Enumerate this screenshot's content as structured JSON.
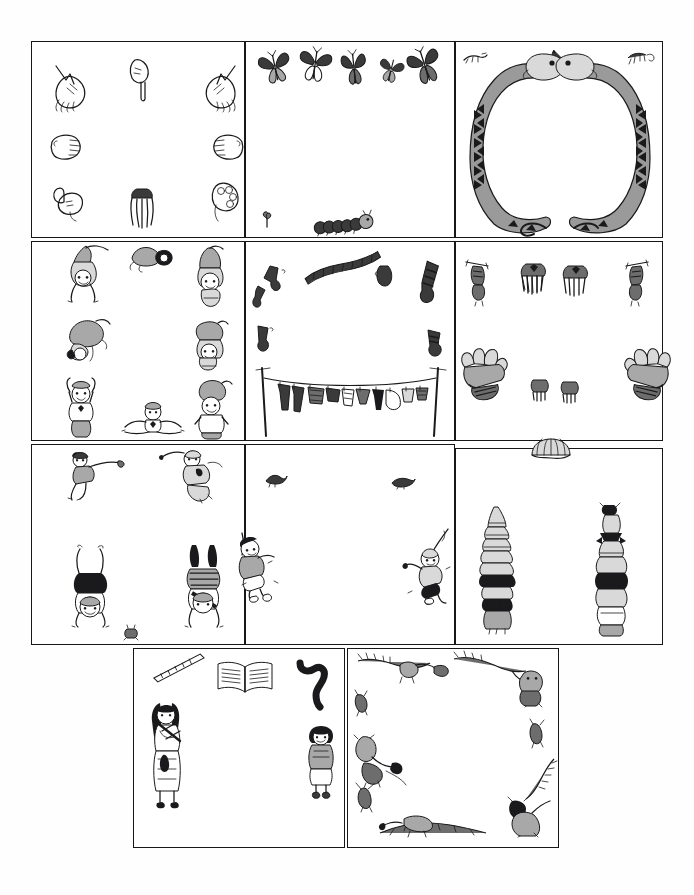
{
  "sheet": {
    "title": "Illustrated Story Panel Grid",
    "background_color": "#ffffff",
    "ink_color": "#1a1a1c",
    "panel_border_color": "#17171a",
    "width": 694,
    "height": 895,
    "description": "Ten rectangular illustration frames arranged in four rows; each frame holds small black-and-white drawings placed around an empty white centre."
  },
  "panels": [
    {
      "id": "panel-hands",
      "row": 1,
      "column": 1,
      "theme": "hands",
      "caption": "Hands",
      "x": 31,
      "y": 41,
      "w": 214,
      "h": 197,
      "items": [
        {
          "name": "open-hand-reaching",
          "note": "open palm, fingers splayed, pointing down-right",
          "x": 18,
          "y": 18,
          "scale": 1.0,
          "rotate": 0
        },
        {
          "name": "pointing-hand",
          "note": "index finger pointing downward",
          "x": 95,
          "y": 14,
          "scale": 0.9,
          "rotate": 0
        },
        {
          "name": "open-hand-reaching-mirrored",
          "note": "open palm mirrored, fingers splayed",
          "x": 165,
          "y": 18,
          "scale": 1.0,
          "rotate": 0
        },
        {
          "name": "fist-left",
          "note": "closed fist facing right",
          "x": 16,
          "y": 90,
          "scale": 0.85,
          "rotate": 0
        },
        {
          "name": "fist-right",
          "note": "closed fist facing left",
          "x": 178,
          "y": 90,
          "scale": 0.85,
          "rotate": 0
        },
        {
          "name": "thumbs-up-hand",
          "note": "hand with thumb raised",
          "x": 18,
          "y": 140,
          "scale": 0.9,
          "rotate": 0
        },
        {
          "name": "praying-hands",
          "note": "two hands together, fingers down",
          "x": 96,
          "y": 145,
          "scale": 0.9,
          "rotate": 0
        },
        {
          "name": "grasping-fist",
          "note": "fist with knuckles toward viewer",
          "x": 176,
          "y": 138,
          "scale": 0.9,
          "rotate": 0
        }
      ]
    },
    {
      "id": "panel-butterflies",
      "row": 1,
      "column": 2,
      "theme": "butterflies and caterpillar",
      "caption": "Butterflies",
      "x": 245,
      "y": 41,
      "w": 210,
      "h": 197,
      "items": [
        {
          "name": "butterfly",
          "x": 12,
          "y": 8,
          "scale": 1.0,
          "rotate": -12
        },
        {
          "name": "butterfly",
          "x": 52,
          "y": 6,
          "scale": 1.05,
          "rotate": 8
        },
        {
          "name": "butterfly",
          "x": 92,
          "y": 8,
          "scale": 1.0,
          "rotate": -6
        },
        {
          "name": "butterfly",
          "x": 128,
          "y": 12,
          "scale": 0.85,
          "rotate": 14
        },
        {
          "name": "butterfly",
          "x": 162,
          "y": 6,
          "scale": 1.05,
          "rotate": -18
        },
        {
          "name": "small-sprout",
          "x": 14,
          "y": 168,
          "scale": 0.7,
          "rotate": 0
        },
        {
          "name": "caterpillar",
          "x": 66,
          "y": 170,
          "scale": 1.0,
          "rotate": -4
        }
      ]
    },
    {
      "id": "panel-snakes",
      "row": 1,
      "column": 3,
      "theme": "two snakes forming a loop",
      "caption": "Snakes",
      "x": 455,
      "y": 41,
      "w": 208,
      "h": 197,
      "items": [
        {
          "name": "snake-loop",
          "note": "two long patterned snakes head-to-head forming an oval frame with tails crossing at the bottom",
          "x": 6,
          "y": 10,
          "scale": 1.0,
          "rotate": 0
        },
        {
          "name": "small-lizard-left",
          "x": 6,
          "y": 8,
          "scale": 0.6,
          "rotate": 0
        },
        {
          "name": "small-lizard-right",
          "x": 170,
          "y": 8,
          "scale": 0.6,
          "rotate": 0
        },
        {
          "name": "tiny-snake-centre",
          "x": 92,
          "y": 6,
          "scale": 0.55,
          "rotate": 0
        }
      ]
    },
    {
      "id": "panel-acrobats",
      "row": 2,
      "column": 1,
      "theme": "tumbling children",
      "caption": "Acrobats",
      "x": 31,
      "y": 241,
      "w": 214,
      "h": 200,
      "items": [
        {
          "name": "child-upside-down",
          "x": 32,
          "y": 4,
          "scale": 1.0,
          "rotate": 170
        },
        {
          "name": "child-diving",
          "x": 98,
          "y": 2,
          "scale": 0.9,
          "rotate": 200
        },
        {
          "name": "child-headstand",
          "x": 160,
          "y": 6,
          "scale": 1.0,
          "rotate": 180
        },
        {
          "name": "child-rolling",
          "x": 30,
          "y": 76,
          "scale": 0.95,
          "rotate": 120
        },
        {
          "name": "child-crouching",
          "x": 156,
          "y": 80,
          "scale": 0.95,
          "rotate": 20
        },
        {
          "name": "child-arms-up",
          "x": 30,
          "y": 140,
          "scale": 1.0,
          "rotate": 0
        },
        {
          "name": "child-splits",
          "x": 92,
          "y": 160,
          "scale": 0.95,
          "rotate": 0
        },
        {
          "name": "child-kneeling",
          "x": 158,
          "y": 140,
          "scale": 1.0,
          "rotate": 0
        }
      ]
    },
    {
      "id": "panel-laundry",
      "row": 2,
      "column": 2,
      "theme": "washing line and flying clothes",
      "caption": "Laundry",
      "x": 245,
      "y": 241,
      "w": 210,
      "h": 200,
      "items": [
        {
          "name": "sock-pair-upper-left",
          "x": 8,
          "y": 26,
          "scale": 0.9,
          "rotate": -20
        },
        {
          "name": "scarf",
          "x": 60,
          "y": 18,
          "scale": 1.0,
          "rotate": -8
        },
        {
          "name": "mitten-centre",
          "x": 130,
          "y": 24,
          "scale": 0.7,
          "rotate": 0
        },
        {
          "name": "striped-sock-right",
          "x": 172,
          "y": 22,
          "scale": 0.95,
          "rotate": 14
        },
        {
          "name": "sock-lower-left",
          "x": 8,
          "y": 84,
          "scale": 0.7,
          "rotate": -10
        },
        {
          "name": "sock-lower-right",
          "x": 178,
          "y": 88,
          "scale": 0.75,
          "rotate": 8
        },
        {
          "name": "clothesline",
          "note": "rope strung between two leaning poles hung with shirts, trousers, socks and vests",
          "x": 6,
          "y": 126,
          "scale": 1.0,
          "rotate": 0
        }
      ]
    },
    {
      "id": "panel-gloves",
      "row": 2,
      "column": 3,
      "theme": "gloves and mittens",
      "caption": "Gloves",
      "x": 455,
      "y": 241,
      "w": 208,
      "h": 200,
      "items": [
        {
          "name": "glove-on-stick-left",
          "x": 8,
          "y": 18,
          "scale": 1.0,
          "rotate": 0
        },
        {
          "name": "mitten-pair-left",
          "x": 62,
          "y": 20,
          "scale": 0.9,
          "rotate": -6
        },
        {
          "name": "mitten-pair-right",
          "x": 104,
          "y": 22,
          "scale": 0.9,
          "rotate": 6
        },
        {
          "name": "glove-on-stick-right",
          "x": 168,
          "y": 18,
          "scale": 1.0,
          "rotate": 0
        },
        {
          "name": "glove-bundle-left",
          "x": 6,
          "y": 104,
          "scale": 1.0,
          "rotate": -8
        },
        {
          "name": "small-glove-centre-left",
          "x": 74,
          "y": 136,
          "scale": 0.6,
          "rotate": 0
        },
        {
          "name": "small-glove-centre-right",
          "x": 104,
          "y": 138,
          "scale": 0.6,
          "rotate": 0
        },
        {
          "name": "glove-bundle-right",
          "x": 166,
          "y": 104,
          "scale": 1.0,
          "rotate": 8
        }
      ]
    },
    {
      "id": "panel-handstands",
      "row": 3,
      "column": 1,
      "theme": "leaping and handstanding children",
      "caption": "Handstands",
      "x": 31,
      "y": 444,
      "w": 214,
      "h": 201,
      "items": [
        {
          "name": "child-leaping-left",
          "x": 34,
          "y": 6,
          "scale": 1.0,
          "rotate": 0
        },
        {
          "name": "child-leaping-right",
          "x": 128,
          "y": 4,
          "scale": 1.0,
          "rotate": 0
        },
        {
          "name": "child-handstand-left",
          "x": 36,
          "y": 104,
          "scale": 1.05,
          "rotate": 0
        },
        {
          "name": "child-handstand-right",
          "x": 148,
          "y": 102,
          "scale": 1.05,
          "rotate": 0
        },
        {
          "name": "small-frog",
          "x": 92,
          "y": 182,
          "scale": 0.5,
          "rotate": 0
        }
      ]
    },
    {
      "id": "panel-swings",
      "row": 3,
      "column": 2,
      "theme": "children on swings",
      "caption": "Swings",
      "x": 245,
      "y": 444,
      "w": 210,
      "h": 201,
      "items": [
        {
          "name": "bird-left",
          "x": 18,
          "y": 28,
          "scale": 0.6,
          "rotate": 0
        },
        {
          "name": "bird-right",
          "x": 146,
          "y": 32,
          "scale": 0.6,
          "rotate": 0
        },
        {
          "name": "child-on-swing-left",
          "x": -6,
          "y": 92,
          "scale": 1.0,
          "rotate": 0
        },
        {
          "name": "child-on-swing-right",
          "x": 158,
          "y": 90,
          "scale": 1.0,
          "rotate": 0
        }
      ]
    },
    {
      "id": "panel-hats",
      "row": 3,
      "column": 3,
      "theme": "stacks of hats",
      "caption": "Hats",
      "x": 455,
      "y": 448,
      "w": 208,
      "h": 197,
      "items": [
        {
          "name": "umbrella-hat-top",
          "note": "fan-shaped hat overlapping the top frame line",
          "x": 74,
          "y": -8,
          "scale": 1.0,
          "rotate": 0
        },
        {
          "name": "hat-stack-left",
          "note": "child carrying a tall tower of hats",
          "x": 22,
          "y": 58,
          "scale": 1.0,
          "rotate": 0
        },
        {
          "name": "hat-stack-right",
          "note": "child carrying a tall tower of hats topped with a bird",
          "x": 134,
          "y": 56,
          "scale": 1.0,
          "rotate": 0
        }
      ]
    },
    {
      "id": "panel-flute-girl",
      "row": 4,
      "column": 1,
      "theme": "girl with flute, book, ruler and snake",
      "caption": "Flute",
      "x": 133,
      "y": 648,
      "w": 212,
      "h": 200,
      "items": [
        {
          "name": "ruler",
          "x": 20,
          "y": 14,
          "scale": 1.0,
          "rotate": -22
        },
        {
          "name": "open-book",
          "x": 84,
          "y": 12,
          "scale": 1.0,
          "rotate": 0
        },
        {
          "name": "wavy-snake",
          "x": 164,
          "y": 10,
          "scale": 1.0,
          "rotate": 0
        },
        {
          "name": "girl-playing-flute",
          "x": 14,
          "y": 52,
          "scale": 1.0,
          "rotate": 0
        },
        {
          "name": "small-girl-standing",
          "x": 172,
          "y": 76,
          "scale": 0.85,
          "rotate": 0
        }
      ]
    },
    {
      "id": "panel-monkeys",
      "row": 4,
      "column": 2,
      "theme": "monkeys on branches",
      "caption": "Monkeys",
      "x": 347,
      "y": 648,
      "w": 212,
      "h": 200,
      "items": [
        {
          "name": "monkey-on-branch-top-left",
          "x": 10,
          "y": 4,
          "scale": 1.0,
          "rotate": 0
        },
        {
          "name": "monkey-on-branch-top-right",
          "x": 110,
          "y": 4,
          "scale": 1.0,
          "rotate": 0
        },
        {
          "name": "small-monkey-upper-left",
          "x": 4,
          "y": 42,
          "scale": 0.55,
          "rotate": 0
        },
        {
          "name": "monkey-hanging-left",
          "x": 4,
          "y": 88,
          "scale": 0.95,
          "rotate": 0
        },
        {
          "name": "small-monkey-right",
          "x": 178,
          "y": 72,
          "scale": 0.55,
          "rotate": 0
        },
        {
          "name": "monkey-climbing-right",
          "x": 160,
          "y": 112,
          "scale": 1.0,
          "rotate": 0
        },
        {
          "name": "small-monkey-lower-left",
          "x": 6,
          "y": 134,
          "scale": 0.55,
          "rotate": 0
        },
        {
          "name": "monkey-on-branch-bottom",
          "x": 30,
          "y": 166,
          "scale": 1.0,
          "rotate": 0
        }
      ]
    }
  ]
}
